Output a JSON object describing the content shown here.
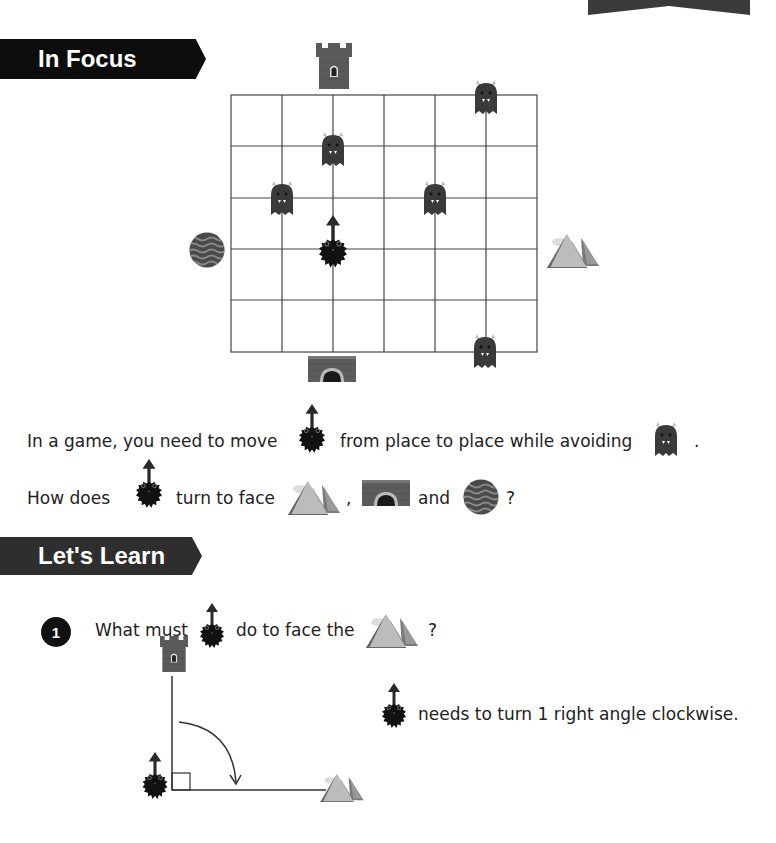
{
  "page": {
    "sections": {
      "in_focus": {
        "title": "In Focus"
      },
      "lets_learn": {
        "title": "Let's Learn"
      }
    },
    "game_board": {
      "columns": 6,
      "rows": 5,
      "hero": {
        "name": "hedgehog-monster",
        "facing": "up"
      },
      "monsters_count": 5,
      "landmarks": {
        "top": "tower",
        "right": "mountains",
        "bottom": "bridge",
        "left": "water"
      }
    },
    "intro": {
      "line1_part1": "In a game, you need to move",
      "line1_part2": "from place to place while avoiding",
      "line1_end": ".",
      "line2_part1": "How does",
      "line2_part2": "turn to face",
      "line2_comma": ",",
      "line2_and": "and",
      "line2_end": "?"
    },
    "question1": {
      "number": "1",
      "text_part1": "What must",
      "text_part2": "do to face the",
      "text_end": "?",
      "answer": "needs to turn 1 right angle clockwise."
    }
  }
}
